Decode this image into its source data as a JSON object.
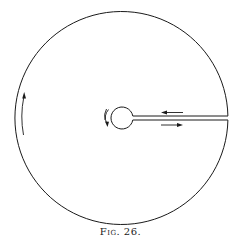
{
  "figure": {
    "caption": "Fig. 26.",
    "stroke_color": "#1a1a1a",
    "background": "#ffffff",
    "outer_circle": {
      "cx": 121.5,
      "cy": 117,
      "r": 106.5
    },
    "inner_circle": {
      "cx": 122,
      "cy": 118,
      "r": 11
    },
    "channel": {
      "x_start": 132,
      "x_end": 228,
      "y_upper": 116,
      "y_lower": 120
    },
    "arrows": [
      {
        "name": "channel-upper-arrow",
        "direction": "left"
      },
      {
        "name": "channel-lower-arrow",
        "direction": "right"
      },
      {
        "name": "outer-rim-arrow",
        "direction": "up"
      },
      {
        "name": "inner-circle-arrow",
        "direction": "down"
      }
    ]
  }
}
